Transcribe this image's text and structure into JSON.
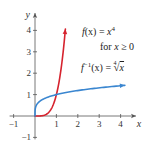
{
  "chart_data": {
    "type": "line",
    "title": "",
    "xlabel": "x",
    "ylabel": "y",
    "xlim": [
      -1,
      4.6
    ],
    "ylim": [
      -1,
      4.7
    ],
    "grid": false,
    "x_ticks": [
      -1,
      1,
      2,
      3,
      4
    ],
    "x_tick_labels": [
      "−1",
      "1",
      "2",
      "3",
      "4"
    ],
    "y_ticks": [
      -1,
      1,
      2,
      3,
      4
    ],
    "y_tick_labels": [
      "−1",
      "1",
      "2",
      "3",
      "4"
    ],
    "series": [
      {
        "name": "f(x) = x^4 for x ≥ 0",
        "color": "#d6232e",
        "domain": [
          0,
          1.42
        ],
        "x": [
          0,
          0.2,
          0.4,
          0.6,
          0.8,
          1.0,
          1.1,
          1.2,
          1.3,
          1.42
        ],
        "y": [
          0,
          0.0016,
          0.0256,
          0.1296,
          0.4096,
          1.0,
          1.4641,
          2.0736,
          2.8561,
          4.066
        ],
        "arrow_end": true
      },
      {
        "name": "f^-1(x) = fourth root of x",
        "color": "#3a86d0",
        "domain": [
          0,
          4.2
        ],
        "x": [
          0,
          0.01,
          0.05,
          0.1,
          0.3,
          0.6,
          1.0,
          1.5,
          2.0,
          3.0,
          4.0,
          4.2
        ],
        "y": [
          0,
          0.316,
          0.473,
          0.562,
          0.74,
          0.88,
          1.0,
          1.107,
          1.189,
          1.316,
          1.414,
          1.432
        ],
        "arrow_end": true
      }
    ],
    "annotations": [
      {
        "text": "f(x) = x^4",
        "x": 2.2,
        "y": 4.0
      },
      {
        "text": "for x ≥ 0",
        "x": 3.1,
        "y": 3.3
      },
      {
        "text": "f^-1(x) = ⁴√x",
        "x": 2.2,
        "y": 2.5
      }
    ]
  },
  "labels": {
    "f_name": "f",
    "f_arg": "(x) = ",
    "f_var": "x",
    "f_exp": "4",
    "dom_for": "for ",
    "dom_var": "x",
    "dom_rest": " ≥ 0",
    "inv_name": "f",
    "inv_exp": "−1",
    "inv_arg": "(x) = ",
    "inv_index": "4",
    "inv_var": "x"
  }
}
